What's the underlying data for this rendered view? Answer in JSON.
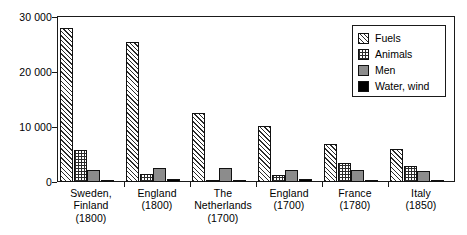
{
  "chart_data": {
    "type": "bar",
    "title": "",
    "subtitle": "",
    "xlabel": "",
    "ylabel": "",
    "ylim": [
      0,
      30000
    ],
    "yticks": [
      0,
      10000,
      20000,
      30000
    ],
    "ytick_labels": [
      "0",
      "10 000",
      "20 000",
      "30 000"
    ],
    "grid": false,
    "legend_position": "top-right",
    "categories": [
      "Sweden, Finland (1800)",
      "England (1800)",
      "The Netherlands (1700)",
      "England (1700)",
      "France (1780)",
      "Italy (1850)"
    ],
    "category_lines": [
      [
        "Sweden,",
        "Finland",
        "(1800)"
      ],
      [
        "England",
        "(1800)"
      ],
      [
        "The",
        "Netherlands",
        "(1700)"
      ],
      [
        "England",
        "(1700)"
      ],
      [
        "France",
        "(1780)"
      ],
      [
        "Italy",
        "(1850)"
      ]
    ],
    "series": [
      {
        "name": "Fuels",
        "pattern": "diagonal-hatch",
        "color": "#ffffff",
        "values": [
          28000,
          25500,
          12500,
          10200,
          7000,
          6000
        ]
      },
      {
        "name": "Animals",
        "pattern": "checker-dots",
        "color": "#ffffff",
        "values": [
          5900,
          1500,
          400,
          1200,
          3400,
          3000
        ]
      },
      {
        "name": "Men",
        "pattern": "solid-gray",
        "color": "#8c8c8c",
        "values": [
          2200,
          2500,
          2500,
          2200,
          2100,
          2000
        ]
      },
      {
        "name": "Water, wind",
        "pattern": "solid-black",
        "color": "#000000",
        "values": [
          150,
          600,
          120,
          550,
          250,
          400
        ]
      }
    ]
  },
  "legend": {
    "entries": [
      {
        "label": "Fuels"
      },
      {
        "label": "Animals"
      },
      {
        "label": "Men"
      },
      {
        "label": "Water, wind"
      }
    ]
  }
}
